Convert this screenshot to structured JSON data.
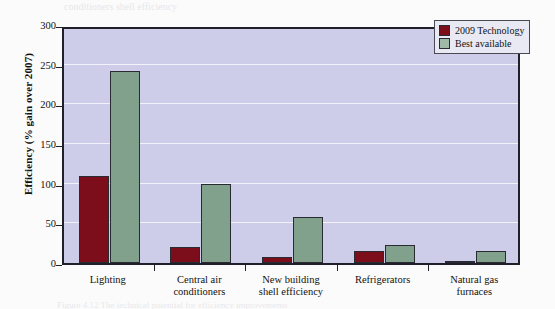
{
  "chart_data": {
    "type": "bar",
    "title": "",
    "xlabel": "",
    "ylabel": "Efficiency (% gain over 2007)",
    "ylim": [
      0,
      300
    ],
    "yticks": [
      0,
      50,
      100,
      150,
      200,
      250,
      300
    ],
    "grid": true,
    "legend_position": "top-right",
    "categories": [
      "Lighting",
      "Central air conditioners",
      "New building shell efficiency",
      "Refrigerators",
      "Natural gas furnaces"
    ],
    "category_lines": [
      [
        "Lighting"
      ],
      [
        "Central air",
        "conditioners"
      ],
      [
        "New building",
        "shell efficiency"
      ],
      [
        "Refrigerators"
      ],
      [
        "Natural gas",
        "furnaces"
      ]
    ],
    "series": [
      {
        "name": "2009 Technology",
        "color": "#7b0e1a",
        "values": [
          110,
          20,
          8,
          15,
          2
        ]
      },
      {
        "name": "Best available",
        "color": "#82a18c",
        "values": [
          242,
          100,
          58,
          23,
          15
        ]
      }
    ]
  },
  "legend": {
    "items": [
      {
        "label": "2009 Technology"
      },
      {
        "label": "Best available"
      }
    ]
  },
  "credit": {
    "text": "Data are from the Energy Information Administration's Annual Energy Outlook, 2009."
  },
  "artifacts": {
    "bleed_text": "conditioners        shell efficiency",
    "caption_text": "Figure 4.12   The technical potential for efficiency improvements"
  },
  "colors": {
    "series_2009": "#7b0e1a",
    "series_best": "#82a18c",
    "plot_background": "#cdcde9",
    "gridline": "#f2f2fa",
    "axis": "#20202a"
  }
}
